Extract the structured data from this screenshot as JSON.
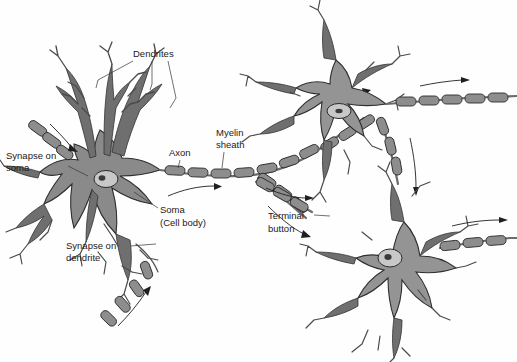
{
  "figure": {
    "background_color": "#fefefe",
    "ink_color": "#2e2e2e",
    "soma_color": "#8a8a8a",
    "myelin_color": "#8d8d8d"
  },
  "labels": {
    "dendrites": "Dendrites",
    "synapse_on_soma": "Synapse on\nsoma",
    "synapse_on_soma_line1": "Synapse on",
    "synapse_on_soma_line2": "soma",
    "synapse_on_dendrite_line1": "Synapse on",
    "synapse_on_dendrite_line2": "dendrite",
    "axon": "Axon",
    "myelin_sheath_line1": "Myelin",
    "myelin_sheath_line2": "sheath",
    "soma_line1": "Soma",
    "soma_line2": "(Cell body)",
    "terminal_button_line1": "Terminal",
    "terminal_button_line2": "button"
  },
  "neurons": [
    {
      "name": "main-neuron",
      "position": "left-center"
    },
    {
      "name": "upper-right-neuron",
      "position": "top-right"
    },
    {
      "name": "lower-right-neuron",
      "position": "bottom-right"
    }
  ],
  "parts": [
    "dendrites",
    "soma",
    "nucleus",
    "axon",
    "myelin-sheath",
    "terminal-button",
    "synapse-on-soma",
    "synapse-on-dendrite"
  ]
}
